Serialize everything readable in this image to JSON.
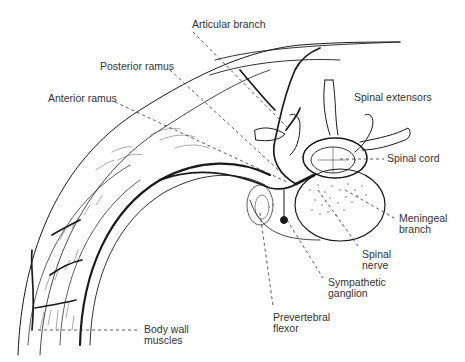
{
  "figure": {
    "type": "anatomical cross-section line drawing",
    "background": "#ffffff",
    "line_color": "#1a1a1a",
    "label_color": "#333333"
  },
  "labels": {
    "articular_branch": "Articular branch",
    "posterior_ramus": "Posterior ramus",
    "anterior_ramus": "Anterior ramus",
    "spinal_extensors": "Spinal extensors",
    "spinal_cord": "Spinal cord",
    "meningeal_branch": {
      "line1": "Meningeal",
      "line2": "branch"
    },
    "spinal_nerve": {
      "line1": "Spinal",
      "line2": "nerve"
    },
    "sympathetic_ganglion": {
      "line1": "Sympathetic",
      "line2": "ganglion"
    },
    "prevertebral_flexor": {
      "line1": "Prevertebral",
      "line2": "flexor"
    },
    "body_wall_muscles": {
      "line1": "Body wall",
      "line2": "muscles"
    }
  }
}
